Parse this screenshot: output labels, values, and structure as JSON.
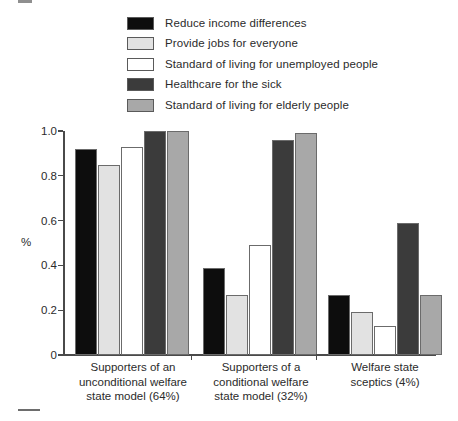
{
  "chart_data": {
    "type": "bar",
    "title": "",
    "xlabel": "",
    "ylabel": "%",
    "ylim": [
      0,
      1.0
    ],
    "ytick_labels": [
      "1.0",
      "0.8",
      "0.6",
      "0.4",
      "0.2",
      "0"
    ],
    "ytick_values": [
      1.0,
      0.8,
      0.6,
      0.4,
      0.2,
      0
    ],
    "grid": false,
    "legend_position": "top",
    "categories": [
      "Supporters of an\nunconditional welfare\nstate model (64%)",
      "Supporters of a\nconditional welfare\nstate model (32%)",
      "Welfare state\nsceptics (4%)"
    ],
    "series": [
      {
        "name": "Reduce income differences",
        "color": "#0d0d0d",
        "values": [
          0.92,
          0.39,
          0.27
        ]
      },
      {
        "name": "Provide jobs for everyone",
        "color": "#e2e2e2",
        "values": [
          0.85,
          0.27,
          0.19
        ]
      },
      {
        "name": "Standard of living for unemployed people",
        "color": "#ffffff",
        "values": [
          0.93,
          0.49,
          0.13
        ]
      },
      {
        "name": "Healthcare for the sick",
        "color": "#3b3b3b",
        "values": [
          1.0,
          0.96,
          0.59
        ]
      },
      {
        "name": "Standard of living for elderly people",
        "color": "#a8a8a8",
        "values": [
          1.0,
          0.99,
          0.27
        ]
      }
    ]
  },
  "marks": {
    "top_mark": "",
    "bottom_mark": ""
  }
}
